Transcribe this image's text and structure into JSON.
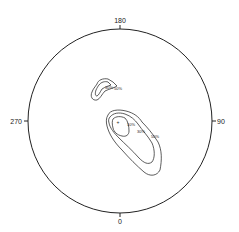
{
  "diagram": {
    "type": "stereonet-contour-plot",
    "directions": {
      "top": "180",
      "bottom": "0",
      "left": "270",
      "right": "90"
    },
    "clusters": [
      {
        "name": "upper-left-cluster",
        "labels": [
          "30%",
          "50%"
        ]
      },
      {
        "name": "main-cluster",
        "labels": [
          "10%",
          "30%",
          "50%"
        ],
        "center_marker": "+"
      }
    ]
  }
}
